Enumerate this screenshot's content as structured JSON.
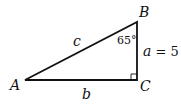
{
  "diagram": {
    "type": "right-triangle",
    "vertices": {
      "A": {
        "label": "A",
        "x": 25,
        "y": 80
      },
      "B": {
        "label": "B",
        "x": 137,
        "y": 22
      },
      "C": {
        "label": "C",
        "x": 137,
        "y": 80
      }
    },
    "sides": {
      "c": {
        "label": "c"
      },
      "b": {
        "label": "b"
      },
      "a": {
        "label_var": "a",
        "label_rest": " = 5"
      }
    },
    "angle_B": {
      "label": "65°"
    },
    "right_angle_at": "C",
    "stroke_color": "#111111"
  }
}
